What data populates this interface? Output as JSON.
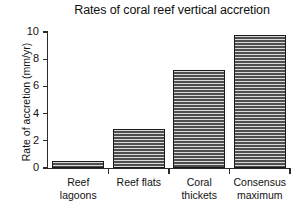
{
  "chart_data": {
    "type": "bar",
    "title": "Rates of coral reef vertical accretion",
    "xlabel": "",
    "ylabel": "Rate of accretion (mm/yr)",
    "categories": [
      "Reef lagoons",
      "Reef flats",
      "Coral thickets",
      "Consensus maximum"
    ],
    "category_lines": [
      [
        "Reef",
        "lagoons"
      ],
      [
        "Reef flats",
        ""
      ],
      [
        "Coral",
        "thickets"
      ],
      [
        "Consensus",
        "maximum"
      ]
    ],
    "values": [
      0.5,
      2.9,
      7.2,
      9.8
    ],
    "ylim": [
      0,
      10
    ],
    "yticks": [
      0,
      2,
      4,
      6,
      8,
      10
    ],
    "ytick_labels": [
      "0",
      "2",
      "4",
      "6",
      "8",
      "10"
    ],
    "grid": false,
    "legend": false,
    "bar_fill": "#4a4a4a",
    "bar_edge": "#1a1a1a",
    "axis_color": "#2b2b2b",
    "background": "#ffffff"
  }
}
